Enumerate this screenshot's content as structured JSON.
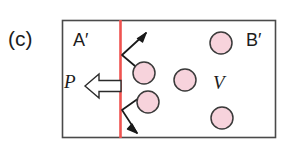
{
  "figure": {
    "panel_label": "(c)",
    "left_region_label": "A′",
    "right_region_label": "B′",
    "pressure_label": "P",
    "volume_label": "V",
    "colors": {
      "particle_fill": "#f7d3dc",
      "particle_stroke": "#3a3a3a",
      "piston_line": "#ef5350",
      "box_border": "#4a4a4a",
      "trajectory": "#1a1a1a",
      "background": "#ffffff"
    },
    "box": {
      "x": 62,
      "y": 20,
      "width": 214,
      "height": 118
    },
    "piston": {
      "x": 120.5,
      "y_top": 20,
      "y_bottom": 138,
      "width": 3
    },
    "pressure_arrow": {
      "direction": "left",
      "tip_x": 85,
      "tail_x": 121,
      "center_y": 86,
      "style": "hollow-block-arrow"
    },
    "particles": [
      {
        "id": "particle-upper-left",
        "cx": 144,
        "cy": 73,
        "r": 11
      },
      {
        "id": "particle-middle",
        "cx": 185,
        "cy": 80,
        "r": 11
      },
      {
        "id": "particle-upper-right",
        "cx": 221,
        "cy": 43,
        "r": 11
      },
      {
        "id": "particle-lower-left",
        "cx": 148,
        "cy": 102,
        "r": 11
      },
      {
        "id": "particle-lower-right",
        "cx": 222,
        "cy": 118,
        "r": 11
      }
    ],
    "trajectories": [
      {
        "id": "trajectory-upper",
        "description": "particle bounces off piston upward-right",
        "points": "135,66 122,55 146,33",
        "arrow_tip": {
          "x": 146,
          "y": 33
        },
        "arrow_angle_deg": -42
      },
      {
        "id": "trajectory-lower",
        "description": "particle bounces off piston downward-right",
        "points": "139,98 122,110 137,133",
        "arrow_tip": {
          "x": 137,
          "y": 133
        },
        "arrow_angle_deg": 57
      }
    ]
  }
}
